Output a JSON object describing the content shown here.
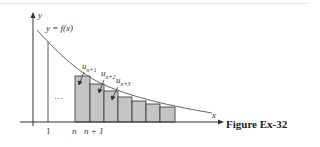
{
  "figure": {
    "caption": "Figure Ex-32",
    "curve_label": "y = f(x)",
    "axis_x_label": "x",
    "axis_y_label": "y",
    "tick_labels": [
      "1",
      "n",
      "n + 1"
    ],
    "ellipsis": "···",
    "term_labels": [
      {
        "base": "u",
        "sub": "n+1"
      },
      {
        "base": "u",
        "sub": "n+2"
      },
      {
        "base": "u",
        "sub": "n+3"
      }
    ],
    "colors": {
      "bar_fill": "#c4c4c4",
      "stroke": "#333333",
      "curve": "#666666"
    }
  }
}
